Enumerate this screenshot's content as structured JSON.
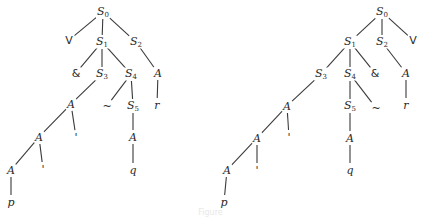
{
  "figure": {
    "caption": "Figure",
    "line_color": "#3a3a3a",
    "text_color": "#2a2a2a"
  },
  "trees": [
    {
      "name": "left-tree",
      "nodes": [
        {
          "id": "S0",
          "label": "S",
          "sub": "0",
          "x": 103,
          "y": 12
        },
        {
          "id": "V",
          "label": "V",
          "x": 69,
          "y": 40,
          "upright": true
        },
        {
          "id": "S1",
          "label": "S",
          "sub": "1",
          "x": 102,
          "y": 42
        },
        {
          "id": "S2",
          "label": "S",
          "sub": "2",
          "x": 136,
          "y": 42
        },
        {
          "id": "amp",
          "label": "&",
          "x": 76,
          "y": 73,
          "upright": true
        },
        {
          "id": "S3",
          "label": "S",
          "sub": "3",
          "x": 102,
          "y": 74
        },
        {
          "id": "S4",
          "label": "S",
          "sub": "4",
          "x": 131,
          "y": 74
        },
        {
          "id": "A_r",
          "label": "A",
          "x": 158,
          "y": 73
        },
        {
          "id": "A1",
          "label": "A",
          "x": 71,
          "y": 104
        },
        {
          "id": "tilde",
          "label": "~",
          "x": 107,
          "y": 106,
          "upright": true
        },
        {
          "id": "S5",
          "label": "S",
          "sub": "5",
          "x": 133,
          "y": 106
        },
        {
          "id": "r",
          "label": "r",
          "x": 157,
          "y": 105
        },
        {
          "id": "A2",
          "label": "A",
          "x": 39,
          "y": 137
        },
        {
          "id": "prime1",
          "label": "'",
          "x": 76,
          "y": 137,
          "upright": true
        },
        {
          "id": "A_q",
          "label": "A",
          "x": 133,
          "y": 137
        },
        {
          "id": "A3",
          "label": "A",
          "x": 11,
          "y": 170
        },
        {
          "id": "prime2",
          "label": "'",
          "x": 43,
          "y": 169,
          "upright": true
        },
        {
          "id": "q",
          "label": "q",
          "x": 133,
          "y": 170
        },
        {
          "id": "p",
          "label": "p",
          "x": 11,
          "y": 202
        }
      ],
      "edges": [
        [
          "S0",
          "V"
        ],
        [
          "S0",
          "S1"
        ],
        [
          "S0",
          "S2"
        ],
        [
          "S1",
          "amp"
        ],
        [
          "S1",
          "S3"
        ],
        [
          "S1",
          "S4"
        ],
        [
          "S2",
          "A_r"
        ],
        [
          "S3",
          "A1"
        ],
        [
          "S4",
          "tilde"
        ],
        [
          "S4",
          "S5"
        ],
        [
          "A_r",
          "r"
        ],
        [
          "A1",
          "A2"
        ],
        [
          "A1",
          "prime1"
        ],
        [
          "S5",
          "A_q"
        ],
        [
          "A2",
          "A3"
        ],
        [
          "A2",
          "prime2"
        ],
        [
          "A_q",
          "q"
        ],
        [
          "A3",
          "p"
        ]
      ]
    },
    {
      "name": "right-tree",
      "nodes": [
        {
          "id": "S0",
          "label": "S",
          "sub": "0",
          "x": 382,
          "y": 12
        },
        {
          "id": "S1",
          "label": "S",
          "sub": "1",
          "x": 350,
          "y": 42
        },
        {
          "id": "S2",
          "label": "S",
          "sub": "2",
          "x": 382,
          "y": 42
        },
        {
          "id": "V",
          "label": "V",
          "x": 413,
          "y": 40,
          "upright": true
        },
        {
          "id": "S3",
          "label": "S",
          "sub": "3",
          "x": 321,
          "y": 74
        },
        {
          "id": "S4",
          "label": "S",
          "sub": "4",
          "x": 350,
          "y": 74
        },
        {
          "id": "amp",
          "label": "&",
          "x": 375,
          "y": 73,
          "upright": true
        },
        {
          "id": "A_r",
          "label": "A",
          "x": 406,
          "y": 73
        },
        {
          "id": "A1",
          "label": "A",
          "x": 287,
          "y": 106
        },
        {
          "id": "S5",
          "label": "S",
          "sub": "5",
          "x": 350,
          "y": 106
        },
        {
          "id": "tilde",
          "label": "~",
          "x": 376,
          "y": 108,
          "upright": true
        },
        {
          "id": "r",
          "label": "r",
          "x": 406,
          "y": 105
        },
        {
          "id": "A2",
          "label": "A",
          "x": 257,
          "y": 138
        },
        {
          "id": "prime1",
          "label": "'",
          "x": 289,
          "y": 137,
          "upright": true
        },
        {
          "id": "A_q",
          "label": "A",
          "x": 350,
          "y": 138
        },
        {
          "id": "A3",
          "label": "A",
          "x": 227,
          "y": 170
        },
        {
          "id": "prime2",
          "label": "'",
          "x": 257,
          "y": 170,
          "upright": true
        },
        {
          "id": "q",
          "label": "q",
          "x": 350,
          "y": 170
        },
        {
          "id": "p",
          "label": "p",
          "x": 224,
          "y": 202
        }
      ],
      "edges": [
        [
          "S0",
          "S1"
        ],
        [
          "S0",
          "S2"
        ],
        [
          "S0",
          "V"
        ],
        [
          "S1",
          "S3"
        ],
        [
          "S1",
          "S4"
        ],
        [
          "S1",
          "amp"
        ],
        [
          "S2",
          "A_r"
        ],
        [
          "S3",
          "A1"
        ],
        [
          "S4",
          "S5"
        ],
        [
          "S4",
          "tilde"
        ],
        [
          "A_r",
          "r"
        ],
        [
          "A1",
          "A2"
        ],
        [
          "A1",
          "prime1"
        ],
        [
          "S5",
          "A_q"
        ],
        [
          "A2",
          "A3"
        ],
        [
          "A2",
          "prime2"
        ],
        [
          "A_q",
          "q"
        ],
        [
          "A3",
          "p"
        ]
      ]
    }
  ]
}
